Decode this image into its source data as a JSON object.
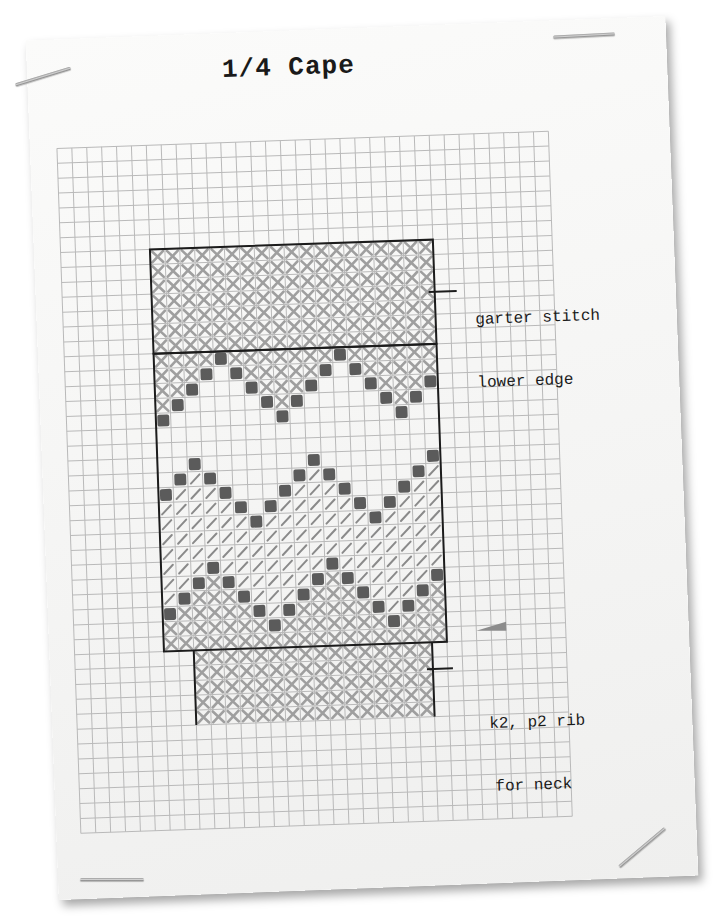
{
  "title": "1/4 Cape",
  "annotations": {
    "garter": {
      "line1": "garter stitch",
      "line2": "lower edge"
    },
    "rib": {
      "line1": "k2, p2 rib",
      "line2": "for neck"
    }
  },
  "colors": {
    "grid": "#b9b9b9",
    "outline": "#1c1c1c",
    "cross": "#9f9f9f",
    "slash": "#8a8a8a",
    "dot": "#4a4a4a",
    "marker": "#8c8c8c"
  },
  "chart": {
    "stitch_key": {
      "X": "garter / cross-hatched stitch",
      "/": "diagonal slash stitch",
      "o": "dark contrast stitch",
      ".": "plain stitch"
    },
    "sections": [
      {
        "name": "garter stitch lower edge",
        "columns": 19,
        "rows": 7,
        "fill": "X"
      },
      {
        "name": "zigzag body",
        "columns": 19,
        "rows": 20,
        "motif_repeat": 8
      },
      {
        "name": "k2, p2 rib for neck",
        "columns": 16,
        "rows": 5,
        "fill": "X"
      }
    ],
    "marker": "triangle pointer at right of body base"
  }
}
